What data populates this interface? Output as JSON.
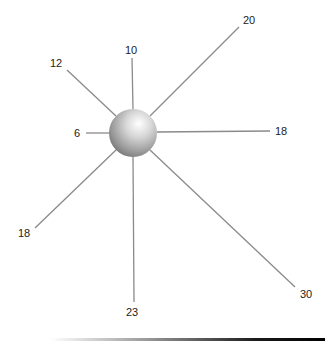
{
  "diagram": {
    "type": "radial-spoke",
    "hub": {
      "cx": 133,
      "cy": 133,
      "r": 24,
      "label": ""
    },
    "spokes": [
      {
        "direction": "up",
        "label": "10",
        "x1": 133,
        "y1": 109,
        "x2": 132,
        "y2": 58,
        "lx": 131,
        "ly": 54
      },
      {
        "direction": "upper-left",
        "label": "12",
        "x1": 116,
        "y1": 116,
        "x2": 67,
        "y2": 70,
        "lx": 56,
        "ly": 67
      },
      {
        "direction": "upper-right",
        "label": "20",
        "x1": 150,
        "y1": 116,
        "x2": 239,
        "y2": 27,
        "lx": 249,
        "ly": 24
      },
      {
        "direction": "left",
        "label": "6",
        "x1": 109,
        "y1": 133,
        "x2": 86,
        "y2": 133,
        "lx": 77,
        "ly": 137
      },
      {
        "direction": "right",
        "label": "18",
        "x1": 157,
        "y1": 132,
        "x2": 270,
        "y2": 131,
        "lx": 281,
        "ly": 135
      },
      {
        "direction": "lower-left",
        "label": "18",
        "x1": 116,
        "y1": 150,
        "x2": 35,
        "y2": 228,
        "lx": 24,
        "ly": 237
      },
      {
        "direction": "down",
        "label": "23",
        "x1": 133,
        "y1": 157,
        "x2": 134,
        "y2": 302,
        "lx": 132,
        "ly": 316
      },
      {
        "direction": "lower-right",
        "label": "30",
        "x1": 150,
        "y1": 150,
        "x2": 295,
        "y2": 287,
        "lx": 306,
        "ly": 298
      }
    ],
    "colors": {
      "spoke": "#8a8a8a",
      "label": "#222222",
      "hub_highlight": "#ffffff",
      "hub_shadow": "#6e6e6e"
    }
  },
  "chart_data": {
    "type": "radial-spoke",
    "title": "",
    "categories": [
      "up",
      "upper-right",
      "right",
      "lower-right",
      "down",
      "lower-left",
      "left",
      "upper-left"
    ],
    "values": [
      10,
      20,
      18,
      30,
      23,
      18,
      6,
      12
    ]
  }
}
